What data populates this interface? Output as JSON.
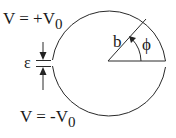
{
  "labels": {
    "top_voltage": "V = +V",
    "top_voltage_sub": "0",
    "bottom_voltage": "V = -V",
    "bottom_voltage_sub": "0",
    "gap": "ε",
    "radius": "b",
    "angle": "ϕ"
  },
  "colors": {
    "stroke": "#2a2a2a",
    "text": "#1a1a1a",
    "background": "#ffffff"
  }
}
